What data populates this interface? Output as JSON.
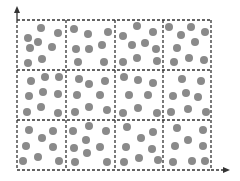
{
  "diagram": {
    "colors": {
      "line": "#333333",
      "dot": "#8a8a8a",
      "background": "#ffffff"
    },
    "grid": {
      "x": [
        17,
        66,
        115,
        163,
        211
      ],
      "y": [
        20,
        70,
        120,
        170
      ],
      "cols": 4,
      "rows": 3
    },
    "axes": {
      "x_axis": {
        "from": [
          17,
          170
        ],
        "to": [
          230,
          170
        ]
      },
      "y_axis": {
        "from": [
          17,
          170
        ],
        "to": [
          17,
          6
        ]
      }
    },
    "dot_radius": 4,
    "dots": [
      [
        41,
        28
      ],
      [
        58,
        33
      ],
      [
        28,
        38
      ],
      [
        38,
        42
      ],
      [
        30,
        48
      ],
      [
        52,
        47
      ],
      [
        42,
        59
      ],
      [
        28,
        63
      ],
      [
        74,
        29
      ],
      [
        88,
        34
      ],
      [
        108,
        32
      ],
      [
        102,
        45
      ],
      [
        76,
        49
      ],
      [
        89,
        49
      ],
      [
        78,
        62
      ],
      [
        104,
        62
      ],
      [
        137,
        26
      ],
      [
        153,
        32
      ],
      [
        123,
        36
      ],
      [
        132,
        45
      ],
      [
        145,
        43
      ],
      [
        156,
        49
      ],
      [
        123,
        62
      ],
      [
        137,
        58
      ],
      [
        157,
        61
      ],
      [
        169,
        27
      ],
      [
        191,
        27
      ],
      [
        205,
        32
      ],
      [
        181,
        35
      ],
      [
        195,
        42
      ],
      [
        177,
        48
      ],
      [
        174,
        62
      ],
      [
        189,
        58
      ],
      [
        204,
        60
      ],
      [
        31,
        81
      ],
      [
        45,
        77
      ],
      [
        59,
        77
      ],
      [
        43,
        92
      ],
      [
        29,
        96
      ],
      [
        58,
        94
      ],
      [
        27,
        112
      ],
      [
        41,
        107
      ],
      [
        58,
        113
      ],
      [
        79,
        79
      ],
      [
        89,
        84
      ],
      [
        105,
        81
      ],
      [
        77,
        95
      ],
      [
        100,
        95
      ],
      [
        89,
        107
      ],
      [
        75,
        112
      ],
      [
        107,
        110
      ],
      [
        124,
        77
      ],
      [
        138,
        80
      ],
      [
        153,
        83
      ],
      [
        129,
        95
      ],
      [
        148,
        95
      ],
      [
        123,
        113
      ],
      [
        138,
        108
      ],
      [
        157,
        113
      ],
      [
        182,
        79
      ],
      [
        201,
        81
      ],
      [
        173,
        96
      ],
      [
        186,
        93
      ],
      [
        198,
        97
      ],
      [
        171,
        112
      ],
      [
        188,
        109
      ],
      [
        206,
        112
      ],
      [
        29,
        130
      ],
      [
        53,
        131
      ],
      [
        42,
        138
      ],
      [
        26,
        146
      ],
      [
        53,
        147
      ],
      [
        38,
        157
      ],
      [
        23,
        161
      ],
      [
        59,
        161
      ],
      [
        89,
        126
      ],
      [
        73,
        131
      ],
      [
        106,
        131
      ],
      [
        86,
        140
      ],
      [
        74,
        148
      ],
      [
        100,
        147
      ],
      [
        87,
        153
      ],
      [
        75,
        162
      ],
      [
        107,
        162
      ],
      [
        127,
        127
      ],
      [
        153,
        132
      ],
      [
        141,
        138
      ],
      [
        126,
        147
      ],
      [
        152,
        149
      ],
      [
        139,
        158
      ],
      [
        124,
        162
      ],
      [
        158,
        160
      ],
      [
        177,
        128
      ],
      [
        203,
        130
      ],
      [
        188,
        140
      ],
      [
        175,
        146
      ],
      [
        203,
        146
      ],
      [
        173,
        162
      ],
      [
        192,
        161
      ],
      [
        205,
        161
      ]
    ]
  }
}
